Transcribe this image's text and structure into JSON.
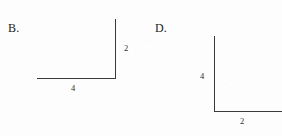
{
  "figure": {
    "background_color": "#fdfdfd",
    "ink_color": "#3a3a3a",
    "panels": [
      {
        "id": "B",
        "label": "B.",
        "shape": "right-angle-L",
        "orientation": "vertical-right-horizontal-bottom",
        "vertical_length_label": "2",
        "horizontal_length_label": "4"
      },
      {
        "id": "D",
        "label": "D.",
        "shape": "right-angle-L",
        "orientation": "vertical-left-horizontal-bottom",
        "vertical_length_label": "4",
        "horizontal_length_label": "2"
      }
    ]
  },
  "chart_data": {
    "type": "diagram",
    "title": "",
    "items": [
      {
        "option": "B.",
        "segments": [
          {
            "name": "vertical-segment",
            "label": "2",
            "length": 2,
            "position": "right"
          },
          {
            "name": "horizontal-segment",
            "label": "4",
            "length": 4,
            "position": "bottom"
          }
        ]
      },
      {
        "option": "D.",
        "segments": [
          {
            "name": "vertical-segment",
            "label": "4",
            "length": 4,
            "position": "left"
          },
          {
            "name": "horizontal-segment",
            "label": "2",
            "length": 2,
            "position": "bottom"
          }
        ]
      }
    ]
  }
}
